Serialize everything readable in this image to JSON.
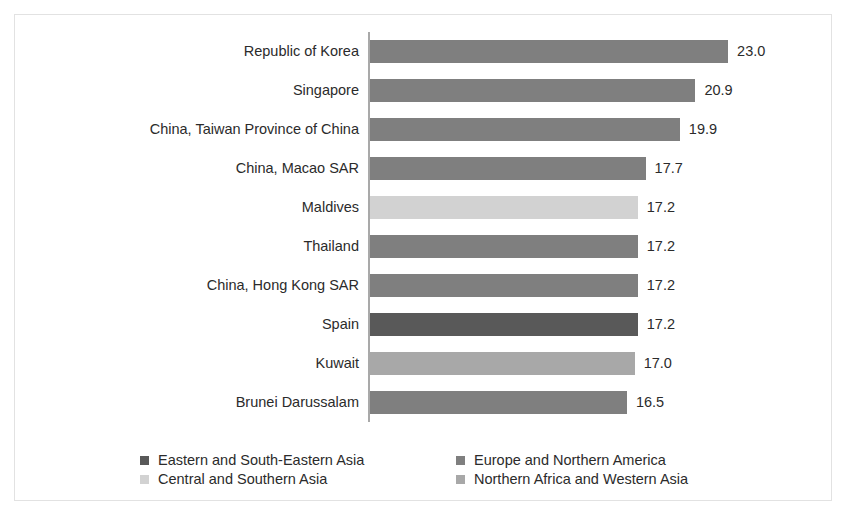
{
  "chart_data": {
    "type": "bar",
    "orientation": "horizontal",
    "title": "",
    "subtitle": "",
    "xlabel": "",
    "ylabel": "",
    "xlim": [
      0,
      23.0
    ],
    "grid": false,
    "legend_position": "bottom",
    "categories": [
      "Republic of Korea",
      "Singapore",
      "China, Taiwan Province of China",
      "China, Macao SAR",
      "Maldives",
      "Thailand",
      "China, Hong Kong SAR",
      "Spain",
      "Kuwait",
      "Brunei Darussalam"
    ],
    "values": [
      23.0,
      20.9,
      19.9,
      17.7,
      17.2,
      17.2,
      17.2,
      17.2,
      17.0,
      16.5
    ],
    "value_labels": [
      "23.0",
      "20.9",
      "19.9",
      "17.7",
      "17.2",
      "17.2",
      "17.2",
      "17.2",
      "17.0",
      "16.5"
    ],
    "series_of_bar": [
      "Eastern and South-Eastern Asia",
      "Eastern and South-Eastern Asia",
      "Eastern and South-Eastern Asia",
      "Eastern and South-Eastern Asia",
      "Central and Southern Asia",
      "Eastern and South-Eastern Asia",
      "Eastern and South-Eastern Asia",
      "Europe and Northern America",
      "Northern Africa and Western Asia",
      "Eastern and South-Eastern Asia"
    ],
    "bar_colors": [
      "#7f7f7f",
      "#7f7f7f",
      "#7f7f7f",
      "#7f7f7f",
      "#d2d2d2",
      "#7f7f7f",
      "#7f7f7f",
      "#595959",
      "#a8a8a8",
      "#7f7f7f"
    ],
    "legend": [
      {
        "label": "Eastern and South-Eastern Asia",
        "color": "#595959"
      },
      {
        "label": "Europe and Northern America",
        "color": "#7f7f7f"
      },
      {
        "label": "Central and Southern Asia",
        "color": "#d2d2d2"
      },
      {
        "label": "Northern Africa and Western Asia",
        "color": "#a8a8a8"
      }
    ]
  },
  "colors": {
    "axis_line": "#a9a9a9",
    "frame": "#e2e2e2",
    "text": "#2b2b2b",
    "background": "#ffffff"
  }
}
